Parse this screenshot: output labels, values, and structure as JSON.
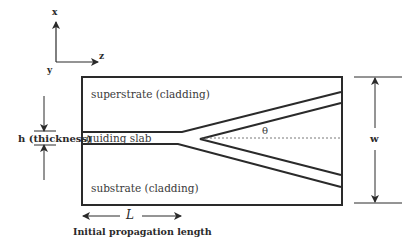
{
  "axes": {
    "x": "x",
    "y": "y",
    "z": "z"
  },
  "regions": {
    "superstrate": "superstrate (cladding)",
    "guiding_slab": "guiding slab",
    "substrate": "substrate (cladding)"
  },
  "dimensions": {
    "thickness": "h (thickness)",
    "width": "w",
    "length_symbol": "L",
    "length_caption": "Initial propagation length",
    "angle": "θ"
  },
  "colors": {
    "line": "#2a2a2a",
    "background": "#ffffff"
  }
}
